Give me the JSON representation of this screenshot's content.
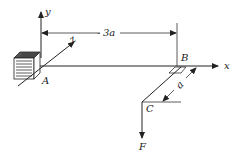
{
  "diagram": {
    "type": "statics-3d-bracket",
    "labels": {
      "y_axis": "y",
      "x_axis": "x",
      "z_axis": "z",
      "point_a": "A",
      "point_b": "B",
      "point_c": "C",
      "force": "F",
      "dim_ab": "3a",
      "dim_bc": "a"
    },
    "colors": {
      "ink": "#222222",
      "background": "#ffffff"
    }
  }
}
